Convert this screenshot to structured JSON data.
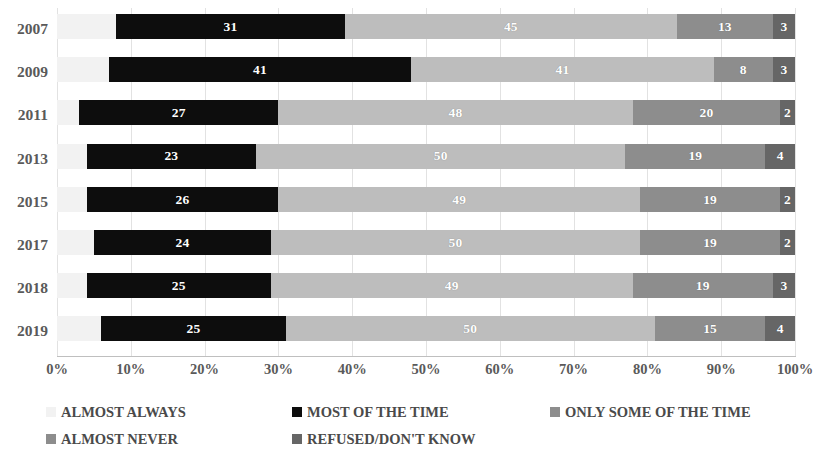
{
  "chart_data": {
    "type": "bar",
    "subtype": "stacked-horizontal-100pct",
    "title": "",
    "xlabel": "",
    "ylabel": "",
    "xlim": [
      0,
      100
    ],
    "xticks": [
      "0%",
      "10%",
      "20%",
      "30%",
      "40%",
      "50%",
      "60%",
      "70%",
      "80%",
      "90%",
      "100%"
    ],
    "grid": true,
    "legend_position": "bottom",
    "categories": [
      "2007",
      "2009",
      "2011",
      "2013",
      "2015",
      "2017",
      "2018",
      "2019"
    ],
    "series": [
      {
        "name": "ALMOST ALWAYS",
        "color": "#f2f2f2",
        "values": [
          8,
          7,
          3,
          4,
          4,
          5,
          4,
          6
        ],
        "labels": [
          "",
          "",
          "",
          "",
          "",
          "",
          "",
          ""
        ]
      },
      {
        "name": "MOST OF THE TIME",
        "color": "#0d0d0d",
        "values": [
          31,
          41,
          27,
          23,
          26,
          24,
          25,
          25
        ],
        "labels": [
          "31",
          "41",
          "27",
          "23",
          "26",
          "24",
          "25",
          "25"
        ]
      },
      {
        "name": "ONLY SOME OF THE TIME",
        "color": "#bdbdbd",
        "values": [
          45,
          41,
          48,
          50,
          49,
          50,
          49,
          50
        ],
        "labels": [
          "45",
          "41",
          "48",
          "50",
          "49",
          "50",
          "49",
          "50"
        ]
      },
      {
        "name": "ALMOST NEVER",
        "color": "#8d8d8d",
        "values": [
          13,
          8,
          20,
          19,
          19,
          19,
          19,
          15
        ],
        "labels": [
          "13",
          "8",
          "20",
          "19",
          "19",
          "19",
          "19",
          "15"
        ]
      },
      {
        "name": "REFUSED/DON'T KNOW",
        "color": "#666666",
        "values": [
          3,
          3,
          2,
          4,
          2,
          2,
          3,
          4
        ],
        "labels": [
          "3",
          "3",
          "2",
          "4",
          "2",
          "2",
          "3",
          "4"
        ]
      }
    ]
  },
  "legend": {
    "items": [
      {
        "label": "ALMOST ALWAYS",
        "color": "#f2f2f2"
      },
      {
        "label": "MOST OF THE TIME",
        "color": "#0d0d0d"
      },
      {
        "label": "ONLY SOME OF THE TIME",
        "color": "#8d8d8d"
      },
      {
        "label": "ALMOST NEVER",
        "color": "#8d8d8d"
      },
      {
        "label": "REFUSED/DON'T KNOW",
        "color": "#666666"
      }
    ]
  }
}
